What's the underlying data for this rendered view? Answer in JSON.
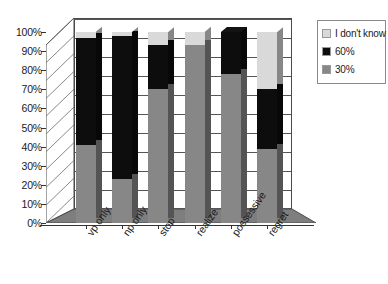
{
  "chart_data": {
    "type": "bar",
    "subtype": "stacked-100-percent-3d",
    "title": "",
    "xlabel": "",
    "ylabel": "",
    "ylim": [
      0,
      100
    ],
    "grid": true,
    "legend_position": "right",
    "categories": [
      "vp only",
      "np only",
      "stop",
      "realize",
      "possessive",
      "regret"
    ],
    "y_tick_labels": [
      "100%",
      "90%",
      "80%",
      "70%",
      "60%",
      "50%",
      "40%",
      "30%",
      "20%",
      "10%",
      "0%"
    ],
    "y_tick_values": [
      100,
      90,
      80,
      70,
      60,
      50,
      40,
      30,
      20,
      10,
      0
    ],
    "series": [
      {
        "name": "30%",
        "color": "#878787",
        "values": [
          41,
          23,
          70,
          93,
          78,
          39
        ]
      },
      {
        "name": "60%",
        "color": "#0d0d0d",
        "values": [
          56,
          75,
          23,
          0,
          22,
          31
        ]
      },
      {
        "name": "I don't know",
        "color": "#d9d9d9",
        "values": [
          3,
          2,
          7,
          7,
          0,
          30
        ]
      }
    ]
  },
  "legend": {
    "items": [
      {
        "label": "I don't know",
        "color": "#d9d9d9"
      },
      {
        "label": "60%",
        "color": "#0d0d0d"
      },
      {
        "label": "30%",
        "color": "#878787"
      }
    ]
  },
  "axis": {
    "y_labels": [
      "100%",
      "90%",
      "80%",
      "70%",
      "60%",
      "50%",
      "40%",
      "30%",
      "20%",
      "10%",
      "0%"
    ],
    "x_labels": [
      "vp only",
      "np only",
      "stop",
      "realize",
      "possessive",
      "regret"
    ]
  },
  "colors": {
    "series_low": "#878787",
    "series_mid": "#0d0d0d",
    "series_unknown": "#d9d9d9",
    "floor": "#7e7e7e",
    "axis": "#333333",
    "grid": "#555555"
  }
}
